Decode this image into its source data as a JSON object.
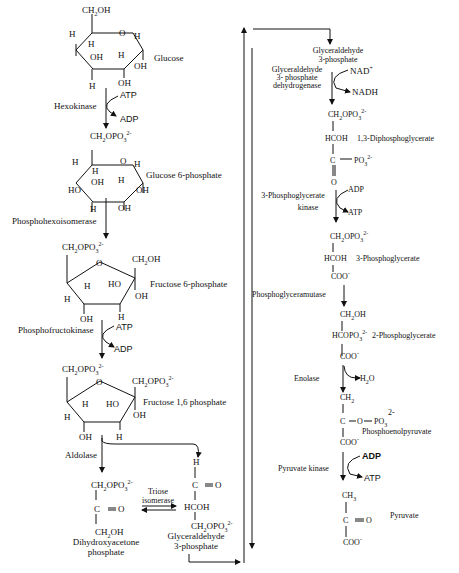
{
  "molecules": {
    "glucose": "Glucose",
    "glucose_6_phosphate": "Glucose 6-phosphate",
    "fructose_6_phosphate": "Fructose 6-phosphate",
    "fructose_1_6_phosphate": "Fructose 1,6 phosphate",
    "dihydroxyacetone_phosphate_1": "Dihydroxyacetone",
    "dihydroxyacetone_phosphate_2": "phosphate",
    "glyceraldehyde_3_phosphate_left_1": "Glyceraldehyde",
    "glyceraldehyde_3_phosphate_left_2": "3-phosphate",
    "glyceraldehyde_3_phosphate_right_1": "Glyceraldehyde",
    "glyceraldehyde_3_phosphate_right_2": "3-phosphate",
    "diphosphoglycerate_1_3": "1,3-Diphosphoglycerate",
    "phosphoglycerate_3": "3-Phosphoglycerate",
    "phosphoglycerate_2": "2-Phosphoglycerate",
    "phosphoenolpyruvate": "Phosphoenolpyruvate",
    "pyruvate": "Pyruvate"
  },
  "enzymes": {
    "hexokinase": "Hexokinase",
    "phosphohexoisomerase": "Phosphohexoisomerase",
    "phosphofructokinase": "Phosphofructokinase",
    "aldolase": "Aldolase",
    "triose_isomerase_1": "Triose",
    "triose_isomerase_2": "isomerase",
    "g3p_dehydrogenase_1": "Glyceraldehyde",
    "g3p_dehydrogenase_2": "3- phosphate",
    "g3p_dehydrogenase_3": "dehydrogenase",
    "pg_kinase_1": "3-Phosphoglycerate",
    "pg_kinase_2": "kinase",
    "phosphoglyceramutase": "Phosphoglyceramutase",
    "enolase": "Enolase",
    "pyruvate_kinase": "Pyruvate kinase"
  },
  "cofactors": {
    "atp": "ATP",
    "adp": "ADP",
    "nad": "NAD",
    "nadh": "NADH",
    "h2o": "H",
    "plus": "+",
    "two_minus": "2-",
    "minus": "-"
  },
  "groups": {
    "ch2oh": "CH",
    "oh": "OH",
    "ho": "HO",
    "h": "H",
    "o": "O",
    "ch2opo3": "CH",
    "opo": "OPO",
    "hcoh": "HCOH",
    "hcopo": "HCOPO",
    "c_eq_o": "C ═ O",
    "c": "C",
    "coo": "COO",
    "ch2": "CH",
    "ch3": "CH",
    "po": "PO",
    "three": "3",
    "two": "2"
  }
}
